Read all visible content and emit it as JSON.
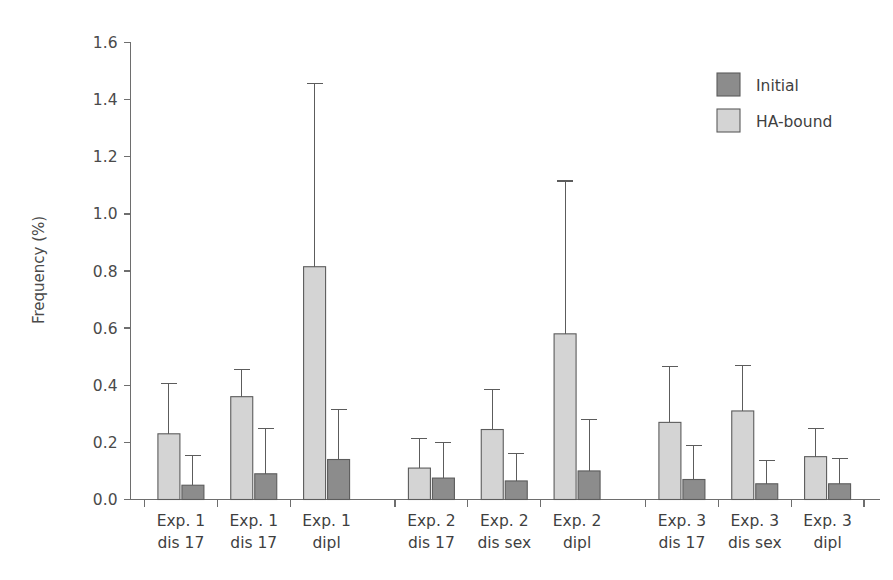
{
  "chart_data": {
    "type": "bar",
    "title": "",
    "subtitle": "",
    "xlabel": "",
    "ylabel": "Frequency (%)",
    "ylim": [
      0.0,
      1.6
    ],
    "ytick_values": [
      0.0,
      0.2,
      0.4,
      0.6,
      0.8,
      1.0,
      1.2,
      1.4,
      1.6
    ],
    "ytick_labels": [
      "0.0",
      "0.2",
      "0.4",
      "0.6",
      "0.8",
      "1.0",
      "1.2",
      "1.4",
      "1.6"
    ],
    "grid": false,
    "legend_position": "top-right",
    "orientation": "vertical",
    "error_bars": "upper-only",
    "categories": [
      "Exp. 1\ndis 17",
      "Exp. 1\ndis 17",
      "Exp. 1\ndipl",
      "Exp. 2\ndis 17",
      "Exp. 2\ndis sex",
      "Exp. 2\ndipl",
      "Exp. 3\ndis 17",
      "Exp. 3\ndis sex",
      "Exp. 3\ndipl"
    ],
    "category_lines": [
      [
        "Exp. 1",
        "dis 17"
      ],
      [
        "Exp. 1",
        "dis 17"
      ],
      [
        "Exp. 1",
        "dipl"
      ],
      [
        "Exp. 2",
        "dis 17"
      ],
      [
        "Exp. 2",
        "dis sex"
      ],
      [
        "Exp. 2",
        "dipl"
      ],
      [
        "Exp. 3",
        "dis 17"
      ],
      [
        "Exp. 3",
        "dis sex"
      ],
      [
        "Exp. 3",
        "dipl"
      ]
    ],
    "groups": [
      "Exp. 1",
      "Exp. 2",
      "Exp. 3"
    ],
    "series": [
      {
        "name": "HA-bound",
        "color": "#d4d4d4",
        "values": [
          0.23,
          0.36,
          0.815,
          0.11,
          0.245,
          0.58,
          0.27,
          0.31,
          0.15
        ],
        "error_upper": [
          0.405,
          0.455,
          1.455,
          0.215,
          0.385,
          1.115,
          0.465,
          0.47,
          0.25
        ]
      },
      {
        "name": "Initial",
        "color": "#8c8c8c",
        "values": [
          0.05,
          0.09,
          0.14,
          0.075,
          0.065,
          0.1,
          0.07,
          0.055,
          0.055
        ],
        "error_upper": [
          0.155,
          0.25,
          0.315,
          0.2,
          0.16,
          0.28,
          0.19,
          0.135,
          0.145
        ]
      }
    ]
  },
  "legend": {
    "items": [
      {
        "label": "Initial",
        "color": "#8c8c8c"
      },
      {
        "label": "HA-bound",
        "color": "#d4d4d4"
      }
    ]
  }
}
